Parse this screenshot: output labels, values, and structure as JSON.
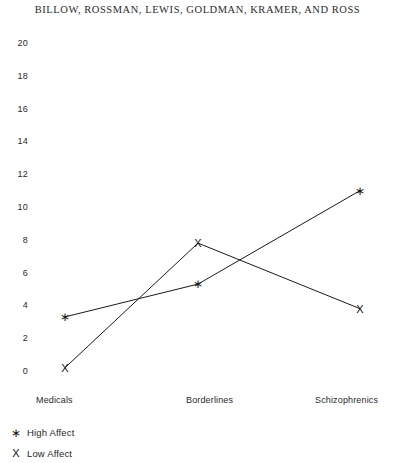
{
  "running_head": "BILLOW, ROSSMAN, LEWIS, GOLDMAN, KRAMER, AND ROSS",
  "legend": {
    "entries": [
      {
        "symbol": "∗",
        "label": "High Affect"
      },
      {
        "symbol": "X",
        "label": "Low Affect"
      }
    ]
  },
  "chart_data": {
    "type": "line",
    "title": "",
    "xlabel": "",
    "ylabel": "",
    "categories": [
      "Medicals",
      "Borderlines",
      "Schizophrenics"
    ],
    "ylim": [
      0,
      20
    ],
    "yticks": [
      20,
      18,
      16,
      14,
      12,
      10,
      8,
      6,
      4,
      2,
      0
    ],
    "grid": false,
    "legend_position": "bottom-left",
    "series": [
      {
        "name": "High Affect",
        "marker": "∗",
        "values": [
          3.3,
          5.3,
          11.0
        ]
      },
      {
        "name": "Low Affect",
        "marker": "X",
        "values": [
          0.2,
          7.8,
          3.8
        ]
      }
    ],
    "colors": {
      "line": "#1a1a1a",
      "marker": "#111111",
      "background": "#ffffff",
      "text": "#2a2a2a"
    }
  }
}
